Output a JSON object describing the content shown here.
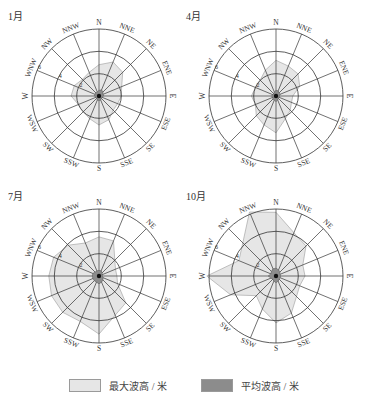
{
  "chart_data": {
    "type": "polar-area (wave rose)",
    "directions": [
      "N",
      "NNE",
      "NE",
      "ENE",
      "E",
      "ESE",
      "SE",
      "SSE",
      "S",
      "SSW",
      "SW",
      "WSW",
      "W",
      "WNW",
      "NW",
      "NNW"
    ],
    "ring_labels": [
      "2",
      "4",
      "6"
    ],
    "ring_values": [
      2,
      4,
      6
    ],
    "rmax": 6,
    "label_direction": "WNW",
    "colors": {
      "max": "#e6e6e6",
      "max_stroke": "#9a9a9a",
      "mean": "#8c8c8c",
      "mean_stroke": "#555555",
      "grid": "#333333"
    },
    "panels": [
      {
        "title": "1月",
        "max": [
          2.8,
          3.3,
          3.0,
          2.2,
          2.0,
          1.8,
          1.8,
          2.3,
          2.6,
          2.2,
          2.0,
          2.0,
          2.5,
          2.4,
          2.1,
          2.3
        ],
        "mean": [
          0.5,
          0.6,
          0.5,
          0.4,
          0.4,
          0.3,
          0.3,
          0.4,
          0.4,
          0.4,
          0.3,
          0.3,
          0.4,
          0.4,
          0.4,
          0.4
        ]
      },
      {
        "title": "4月",
        "max": [
          3.2,
          2.9,
          2.8,
          2.3,
          1.5,
          1.5,
          1.8,
          2.2,
          3.3,
          2.8,
          2.5,
          2.0,
          2.2,
          2.0,
          2.0,
          2.5
        ],
        "mean": [
          0.5,
          0.5,
          0.4,
          0.4,
          0.3,
          0.3,
          0.3,
          0.4,
          0.5,
          0.4,
          0.4,
          0.3,
          0.4,
          0.3,
          0.3,
          0.4
        ]
      },
      {
        "title": "7月",
        "max": [
          3.5,
          3.4,
          2.0,
          1.6,
          1.6,
          1.8,
          3.4,
          3.8,
          5.2,
          4.4,
          4.6,
          4.6,
          4.5,
          4.4,
          3.9,
          3.2
        ],
        "mean": [
          0.5,
          0.5,
          0.4,
          0.3,
          0.3,
          0.4,
          0.5,
          0.6,
          0.7,
          0.6,
          0.6,
          0.6,
          0.6,
          0.6,
          0.5,
          0.5
        ]
      },
      {
        "title": "10月",
        "max": [
          5.7,
          4.2,
          3.8,
          2.6,
          2.6,
          2.3,
          2.6,
          3.6,
          4.2,
          3.2,
          2.5,
          4.4,
          6.2,
          3.6,
          4.2,
          6.2
        ],
        "mean": [
          0.7,
          0.6,
          0.5,
          0.4,
          0.4,
          0.4,
          0.4,
          0.5,
          0.6,
          0.5,
          0.4,
          0.5,
          0.7,
          0.5,
          0.6,
          0.7
        ]
      }
    ],
    "legend": [
      {
        "label": "最大波高 / 米",
        "key": "max"
      },
      {
        "label": "平均波高 / 米",
        "key": "mean"
      }
    ],
    "grid": true,
    "legend_position": "bottom"
  }
}
